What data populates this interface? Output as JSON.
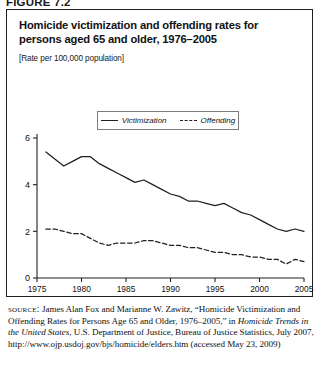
{
  "figure": {
    "label": "FIGURE 7.2"
  },
  "chart_title": "Homicide victimization and offending rates for persons aged 65 and older, 1976–2005",
  "chart_subtitle": "[Rate per 100,000 population]",
  "legend": {
    "position": "top-center-inside",
    "entries": [
      {
        "label": "Victimization",
        "style": "solid"
      },
      {
        "label": "Offending",
        "style": "dashed"
      }
    ]
  },
  "source": {
    "label": "source:",
    "text": " James Alan Fox and Marianne W. Zawitz, “Homicide Victimization and Offending Rates for Persons Age 65 and Older, 1976–2005,” in ",
    "italic_work": "Homicide Trends in the United States",
    "text_after": ", U.S. Department of Justice, Bureau of Justice Statistics, July 2007, http://www.ojp.usdoj.gov/bjs/homicide/elders.htm (accessed May 23, 2009)"
  },
  "chart_data": {
    "type": "line",
    "title": "Homicide victimization and offending rates for persons aged 65 and older, 1976–2005",
    "xlabel": "",
    "ylabel": "",
    "ylim": [
      0,
      6
    ],
    "xlim": [
      1975,
      2005
    ],
    "yticks": [
      0,
      2,
      4,
      6
    ],
    "xticks": [
      1975,
      1980,
      1985,
      1990,
      1995,
      2000,
      2005
    ],
    "grid": false,
    "legend_position": "upper center",
    "units": "Rate per 100,000 population",
    "x": [
      1976,
      1977,
      1978,
      1979,
      1980,
      1981,
      1982,
      1983,
      1984,
      1985,
      1986,
      1987,
      1988,
      1989,
      1990,
      1991,
      1992,
      1993,
      1994,
      1995,
      1996,
      1997,
      1998,
      1999,
      2000,
      2001,
      2002,
      2003,
      2004,
      2005
    ],
    "series": [
      {
        "name": "Victimization",
        "style": "solid",
        "values": [
          5.4,
          5.1,
          4.8,
          5.0,
          5.2,
          5.2,
          4.9,
          4.7,
          4.5,
          4.3,
          4.1,
          4.2,
          4.0,
          3.8,
          3.6,
          3.5,
          3.3,
          3.3,
          3.2,
          3.1,
          3.2,
          3.0,
          2.8,
          2.7,
          2.5,
          2.3,
          2.1,
          2.0,
          2.1,
          2.0
        ]
      },
      {
        "name": "Offending",
        "style": "dashed",
        "values": [
          2.1,
          2.1,
          2.0,
          1.9,
          1.9,
          1.7,
          1.5,
          1.4,
          1.5,
          1.5,
          1.5,
          1.6,
          1.6,
          1.5,
          1.4,
          1.4,
          1.3,
          1.3,
          1.2,
          1.1,
          1.1,
          1.0,
          1.0,
          0.9,
          0.9,
          0.8,
          0.8,
          0.6,
          0.8,
          0.7
        ]
      }
    ]
  }
}
